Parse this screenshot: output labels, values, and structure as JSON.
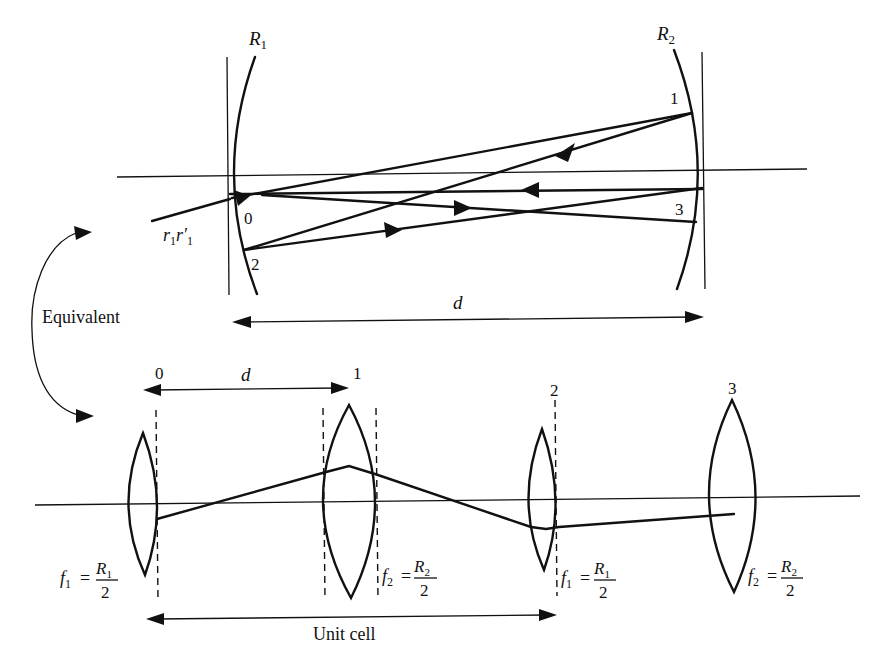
{
  "figure": {
    "top_panel": {
      "title": "Two-mirror resonator",
      "mirror_left_label": "R",
      "mirror_left_sub": "1",
      "mirror_right_label": "R",
      "mirror_right_sub": "2",
      "point_labels": [
        "0",
        "1",
        "2",
        "3"
      ],
      "input_ray_label": "r",
      "input_ray_sub1": "1",
      "input_ray_r2": "r′",
      "input_ray_sub2": "1",
      "separation_label": "d"
    },
    "connector": {
      "label": "Equivalent"
    },
    "bottom_panel": {
      "title": "Equivalent lens waveguide",
      "plane_labels": [
        "0",
        "1",
        "2",
        "3"
      ],
      "spacing_label": "d",
      "unit_cell_label": "Unit cell",
      "lens_formulas": [
        {
          "f": "f",
          "sub": "1",
          "eq": "=",
          "num": "R",
          "num_sub": "1",
          "den": "2"
        },
        {
          "f": "f",
          "sub": "2",
          "eq": "=",
          "num": "R",
          "num_sub": "2",
          "den": "2"
        },
        {
          "f": "f",
          "sub": "1",
          "eq": "=",
          "num": "R",
          "num_sub": "1",
          "den": "2"
        },
        {
          "f": "f",
          "sub": "2",
          "eq": "=",
          "num": "R",
          "num_sub": "2",
          "den": "2"
        }
      ]
    }
  }
}
